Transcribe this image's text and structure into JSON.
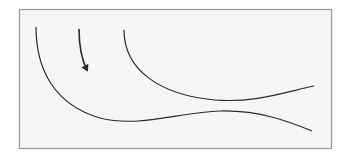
{
  "diagram": {
    "colors": {
      "background": "#ffffff",
      "panel_fill": "#f6f6f6",
      "panel_border": "#9a9a9a",
      "stroke": "#2a2a2a"
    },
    "panel": {
      "x": 19,
      "y": 9,
      "width": 312,
      "height": 139
    },
    "curves": [
      {
        "id": "left-curve",
        "d": "M36,27 C36,70 55,105 100,118 C140,128 180,112 220,111 C260,110 290,122 312,131"
      },
      {
        "id": "right-curve",
        "d": "M124,30 C124,70 160,95 215,100 C255,103 285,92 314,86"
      },
      {
        "id": "arrow-curve",
        "d": "M79,29 C79,45 81,58 87,70",
        "arrowhead": true
      }
    ]
  }
}
